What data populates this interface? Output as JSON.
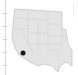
{
  "map": {
    "region": "Western United States",
    "fill_color": "#e4e4e4",
    "border_color": "#c4c4c4",
    "state_line_color": "#d2d2d2",
    "marker": {
      "label": "location-marker",
      "color": "#1a1a1a",
      "cx": 23,
      "cy": 53,
      "r": 2.5
    }
  },
  "axis": {
    "tick_positions": [
      13,
      26,
      39,
      52,
      65
    ]
  }
}
